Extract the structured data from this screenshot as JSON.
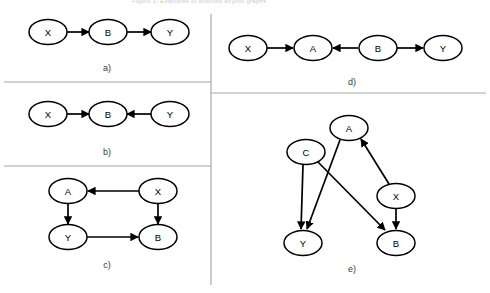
{
  "figure": {
    "cut_off_header": "Figure 1: Examples of directed acyclic graphs",
    "background": "#ffffff",
    "node_fill": "#ffffff",
    "node_stroke": "#000000",
    "edge_color": "#000000",
    "divider_color": "#a8a8a8",
    "label_color": "#3a3a3a",
    "node_label_color": "#000000"
  },
  "panels": [
    {
      "id": "a",
      "caption": "a)",
      "caption_x": 107,
      "caption_y": 71,
      "nodes": [
        {
          "id": "a-X",
          "label": "X",
          "cx": 48,
          "cy": 32
        },
        {
          "id": "a-B",
          "label": "B",
          "cx": 108,
          "cy": 32
        },
        {
          "id": "a-Y",
          "label": "Y",
          "cx": 170,
          "cy": 32
        }
      ],
      "edges": [
        {
          "from": "X",
          "to": "B",
          "x1": 66,
          "y1": 32,
          "x2": 89,
          "y2": 32
        },
        {
          "from": "B",
          "to": "Y",
          "x1": 127,
          "y1": 32,
          "x2": 151,
          "y2": 32
        }
      ]
    },
    {
      "id": "b",
      "caption": "b)",
      "caption_x": 107,
      "caption_y": 155,
      "nodes": [
        {
          "id": "b-X",
          "label": "X",
          "cx": 48,
          "cy": 114
        },
        {
          "id": "b-B",
          "label": "B",
          "cx": 108,
          "cy": 114
        },
        {
          "id": "b-Y",
          "label": "Y",
          "cx": 170,
          "cy": 114
        }
      ],
      "edges": [
        {
          "from": "X",
          "to": "B",
          "x1": 66,
          "y1": 114,
          "x2": 89,
          "y2": 114
        },
        {
          "from": "Y",
          "to": "B",
          "x1": 151,
          "y1": 114,
          "x2": 127,
          "y2": 114
        }
      ]
    },
    {
      "id": "c",
      "caption": "c)",
      "caption_x": 107,
      "caption_y": 268,
      "nodes": [
        {
          "id": "c-A",
          "label": "A",
          "cx": 68,
          "cy": 191
        },
        {
          "id": "c-X",
          "label": "X",
          "cx": 158,
          "cy": 191
        },
        {
          "id": "c-Y",
          "label": "Y",
          "cx": 68,
          "cy": 237
        },
        {
          "id": "c-B",
          "label": "B",
          "cx": 158,
          "cy": 237
        }
      ],
      "edges": [
        {
          "from": "X",
          "to": "A",
          "x1": 139,
          "y1": 191,
          "x2": 88,
          "y2": 191
        },
        {
          "from": "A",
          "to": "Y",
          "x1": 68,
          "y1": 203,
          "x2": 68,
          "y2": 224
        },
        {
          "from": "X",
          "to": "B",
          "x1": 158,
          "y1": 203,
          "x2": 158,
          "y2": 224
        },
        {
          "from": "Y",
          "to": "B",
          "x1": 87,
          "y1": 237,
          "x2": 138,
          "y2": 237
        }
      ]
    },
    {
      "id": "d",
      "caption": "d)",
      "caption_x": 352,
      "caption_y": 85,
      "nodes": [
        {
          "id": "d-X",
          "label": "X",
          "cx": 248,
          "cy": 48
        },
        {
          "id": "d-A",
          "label": "A",
          "cx": 313,
          "cy": 48
        },
        {
          "id": "d-B",
          "label": "B",
          "cx": 378,
          "cy": 48
        },
        {
          "id": "d-Y",
          "label": "Y",
          "cx": 443,
          "cy": 48
        }
      ],
      "edges": [
        {
          "from": "X",
          "to": "A",
          "x1": 267,
          "y1": 48,
          "x2": 293,
          "y2": 48
        },
        {
          "from": "B",
          "to": "A",
          "x1": 358,
          "y1": 48,
          "x2": 333,
          "y2": 48
        },
        {
          "from": "B",
          "to": "Y",
          "x1": 397,
          "y1": 48,
          "x2": 423,
          "y2": 48
        }
      ]
    },
    {
      "id": "e",
      "caption": "e)",
      "caption_x": 352,
      "caption_y": 272,
      "nodes": [
        {
          "id": "e-A",
          "label": "A",
          "cx": 349,
          "cy": 128
        },
        {
          "id": "e-C",
          "label": "C",
          "cx": 306,
          "cy": 152
        },
        {
          "id": "e-X",
          "label": "X",
          "cx": 396,
          "cy": 196
        },
        {
          "id": "e-Y",
          "label": "Y",
          "cx": 303,
          "cy": 243
        },
        {
          "id": "e-B",
          "label": "B",
          "cx": 396,
          "cy": 243
        }
      ],
      "edges": [
        {
          "from": "A",
          "to": "Y",
          "x1": 340,
          "y1": 140,
          "x2": 307,
          "y2": 229
        },
        {
          "from": "C",
          "to": "Y",
          "x1": 303,
          "y1": 165,
          "x2": 301,
          "y2": 229
        },
        {
          "from": "C",
          "to": "B",
          "x1": 318,
          "y1": 162,
          "x2": 385,
          "y2": 230
        },
        {
          "from": "X",
          "to": "A",
          "x1": 389,
          "y1": 184,
          "x2": 361,
          "y2": 139
        },
        {
          "from": "X",
          "to": "B",
          "x1": 396,
          "y1": 209,
          "x2": 396,
          "y2": 229
        }
      ]
    }
  ],
  "dividers": [
    {
      "id": "left-a-b",
      "orientation": "horizontal",
      "x1": 4,
      "y1": 82,
      "x2": 211,
      "y2": 82
    },
    {
      "id": "left-b-c",
      "orientation": "horizontal",
      "x1": 4,
      "y1": 166,
      "x2": 211,
      "y2": 166
    },
    {
      "id": "right-d-e",
      "orientation": "horizontal",
      "x1": 211,
      "y1": 93,
      "x2": 486,
      "y2": 93
    },
    {
      "id": "center-vertical",
      "orientation": "vertical",
      "x1": 211,
      "y1": 14,
      "x2": 211,
      "y2": 285
    }
  ]
}
